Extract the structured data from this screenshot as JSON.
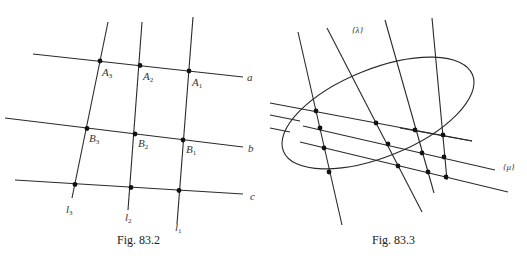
{
  "figures": [
    {
      "id": "fig-83-2",
      "caption": "Fig. 83.2",
      "lines": {
        "horizontal": [
          {
            "name": "a",
            "label": "a"
          },
          {
            "name": "b",
            "label": "b"
          },
          {
            "name": "c",
            "label": "c"
          }
        ],
        "vertical": [
          {
            "name": "l3",
            "label": "l",
            "sub": "3"
          },
          {
            "name": "l2",
            "label": "l",
            "sub": "2"
          },
          {
            "name": "l1",
            "label": "l",
            "sub": "1"
          }
        ]
      },
      "points": [
        {
          "label": "A",
          "sub": "3"
        },
        {
          "label": "A",
          "sub": "2"
        },
        {
          "label": "A",
          "sub": "1"
        },
        {
          "label": "B",
          "sub": "3"
        },
        {
          "label": "B",
          "sub": "2"
        },
        {
          "label": "B",
          "sub": "1"
        }
      ]
    },
    {
      "id": "fig-83-3",
      "caption": "Fig. 83.3",
      "families": [
        {
          "name": "lambda",
          "label": "{λ}"
        },
        {
          "name": "mu",
          "label": "{μ}"
        }
      ],
      "conic": "ellipse"
    }
  ]
}
